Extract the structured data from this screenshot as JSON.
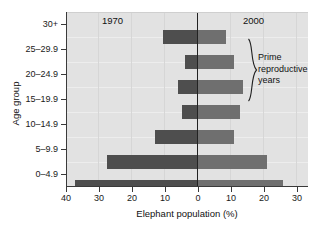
{
  "chart_data": {
    "type": "bar",
    "orientation": "horizontal",
    "subtype": "population-pyramid",
    "title": "",
    "xlabel": "Elephant population (%)",
    "ylabel": "Age group",
    "categories": [
      "0–4.9",
      "5–9.9",
      "10–14.9",
      "15–19.9",
      "20–24.9",
      "25–29.9",
      "30+"
    ],
    "categories_top_to_bottom": [
      "30+",
      "25–29.9",
      "20–24.9",
      "15–19.9",
      "10–14.9",
      "5–9.9",
      "0–4.9"
    ],
    "series": [
      {
        "name": "1970",
        "side": "left",
        "color": "#4e4e4e",
        "values_top_to_bottom": [
          10.3,
          3.7,
          5.8,
          4.6,
          12.8,
          27.5,
          37.5
        ]
      },
      {
        "name": "2000",
        "side": "right",
        "color": "#6f6f6f",
        "values_top_to_bottom": [
          8.9,
          11.3,
          14.1,
          13.2,
          11.5,
          21.5,
          26.5
        ]
      }
    ],
    "xlim": [
      -40,
      30
    ],
    "x_tick_values": [
      -40,
      -30,
      -20,
      -10,
      0,
      10,
      20,
      30
    ],
    "x_tick_labels": [
      "40",
      "30",
      "20",
      "10",
      "0",
      "10",
      "20",
      "30"
    ],
    "grid": "vertical-faint",
    "legend": "inline-era-labels",
    "annotations": [
      {
        "name": "era-left",
        "text": "1970"
      },
      {
        "name": "era-right",
        "text": "2000"
      },
      {
        "name": "prime-bracket",
        "text": "Prime reproductive years",
        "spans": [
          "25–29.9",
          "20–24.9",
          "15–19.9"
        ]
      }
    ]
  },
  "chart": {
    "x_axis_title": "Elephant population (%)",
    "y_axis_title": "Age group",
    "era_left": "1970",
    "era_right": "2000",
    "prime_line1": "Prime",
    "prime_line2": "reproductive",
    "prime_line3": "years"
  },
  "y_tick_labels": [
    "30+",
    "25–29.9",
    "20–24.9",
    "15–19.9",
    "10–14.9",
    "5–9.9",
    "0–4.9"
  ],
  "x_tick_labels": [
    "40",
    "30",
    "20",
    "10",
    "0",
    "10",
    "20",
    "30"
  ],
  "colors": {
    "bar_1970": "#4e4e4e",
    "bar_2000": "#6f6f6f",
    "plot_background": "#e2e2e2",
    "axis": "#3a3a3a",
    "text": "#111111"
  }
}
